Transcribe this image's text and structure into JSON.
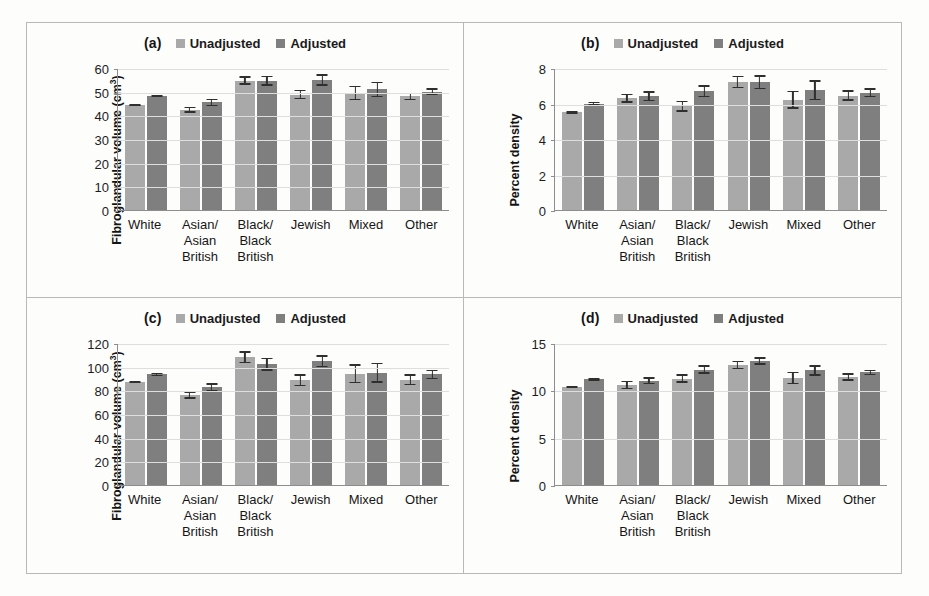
{
  "figure": {
    "categories": [
      "White",
      "Asian/\nAsian\nBritish",
      "Black/\nBlack\nBritish",
      "Jewish",
      "Mixed",
      "Other"
    ],
    "legend": {
      "unadjusted_label": "Unadjusted",
      "adjusted_label": "Adjusted",
      "unadjusted_color": "#a9a9a9",
      "adjusted_color": "#7f7f7f"
    },
    "panels": [
      {
        "tag": "(a)",
        "ylabel_main": "Fibroglandular volume (cm",
        "ylabel_sup": "3",
        "ylabel_tail": ")"
      },
      {
        "tag": "(b)",
        "ylabel_main": "Percent density",
        "ylabel_sup": "",
        "ylabel_tail": ""
      },
      {
        "tag": "(c)",
        "ylabel_main": "Fibroglandular volume (cm",
        "ylabel_sup": "3",
        "ylabel_tail": ")"
      },
      {
        "tag": "(d)",
        "ylabel_main": "Percent density",
        "ylabel_sup": "",
        "ylabel_tail": ""
      }
    ]
  },
  "chart_data": [
    {
      "type": "bar",
      "panel": "(a)",
      "title": "",
      "xlabel": "",
      "ylabel": "Fibroglandular volume (cm3)",
      "ylim": [
        0,
        60
      ],
      "yticks": [
        0,
        10,
        20,
        30,
        40,
        50,
        60
      ],
      "grid": true,
      "legend_position": "top",
      "categories": [
        "White",
        "Asian/ Asian British",
        "Black/ Black British",
        "Jewish",
        "Mixed",
        "Other"
      ],
      "series": [
        {
          "name": "Unadjusted",
          "values": [
            44.2,
            42.3,
            54.7,
            48.8,
            49.5,
            48.0
          ],
          "errors": [
            0.4,
            1.2,
            1.8,
            2.0,
            3.0,
            1.5
          ]
        },
        {
          "name": "Adjusted",
          "values": [
            48.2,
            45.5,
            54.6,
            55.0,
            51.0,
            50.0
          ],
          "errors": [
            0.6,
            1.6,
            2.1,
            2.4,
            3.2,
            1.4
          ]
        }
      ]
    },
    {
      "type": "bar",
      "panel": "(b)",
      "title": "",
      "xlabel": "",
      "ylabel": "Percent density",
      "ylim": [
        0,
        8
      ],
      "yticks": [
        0,
        2,
        4,
        6,
        8
      ],
      "grid": true,
      "legend_position": "top",
      "categories": [
        "White",
        "Asian/ Asian British",
        "Black/ Black British",
        "Jewish",
        "Mixed",
        "Other"
      ],
      "series": [
        {
          "name": "Unadjusted",
          "values": [
            5.5,
            6.3,
            5.85,
            7.2,
            6.2,
            6.45
          ],
          "errors": [
            0.08,
            0.25,
            0.3,
            0.35,
            0.5,
            0.3
          ]
        },
        {
          "name": "Adjusted",
          "values": [
            6.0,
            6.4,
            6.7,
            7.2,
            6.75,
            6.6
          ],
          "errors": [
            0.08,
            0.28,
            0.33,
            0.38,
            0.55,
            0.25
          ]
        }
      ]
    },
    {
      "type": "bar",
      "panel": "(c)",
      "title": "",
      "xlabel": "",
      "ylabel": "Fibroglandular volume (cm3)",
      "ylim": [
        0,
        120
      ],
      "yticks": [
        0,
        20,
        40,
        60,
        80,
        100,
        120
      ],
      "grid": true,
      "legend_position": "top",
      "categories": [
        "White",
        "Asian/ Asian British",
        "Black/ Black British",
        "Jewish",
        "Mixed",
        "Other"
      ],
      "series": [
        {
          "name": "Unadjusted",
          "values": [
            87.0,
            76.0,
            108.0,
            88.5,
            94.0,
            89.0
          ],
          "errors": [
            1.0,
            3.0,
            5.0,
            5.0,
            8.0,
            4.5
          ]
        },
        {
          "name": "Adjusted",
          "values": [
            93.5,
            82.5,
            102.0,
            104.5,
            95.0,
            93.5
          ],
          "errors": [
            1.5,
            3.5,
            5.5,
            5.0,
            8.5,
            4.0
          ]
        }
      ]
    },
    {
      "type": "bar",
      "panel": "(d)",
      "title": "",
      "xlabel": "",
      "ylabel": "Percent density",
      "ylim": [
        0,
        15
      ],
      "yticks": [
        0,
        5,
        10,
        15
      ],
      "grid": true,
      "legend_position": "top",
      "categories": [
        "White",
        "Asian/ Asian British",
        "Black/ Black British",
        "Jewish",
        "Mixed",
        "Other"
      ],
      "series": [
        {
          "name": "Unadjusted",
          "values": [
            10.35,
            10.55,
            11.25,
            12.7,
            11.3,
            11.4
          ],
          "errors": [
            0.12,
            0.45,
            0.45,
            0.45,
            0.65,
            0.4
          ]
        },
        {
          "name": "Adjusted",
          "values": [
            11.15,
            11.0,
            12.2,
            13.1,
            12.1,
            11.9
          ],
          "errors": [
            0.15,
            0.38,
            0.45,
            0.4,
            0.55,
            0.3
          ]
        }
      ]
    }
  ]
}
